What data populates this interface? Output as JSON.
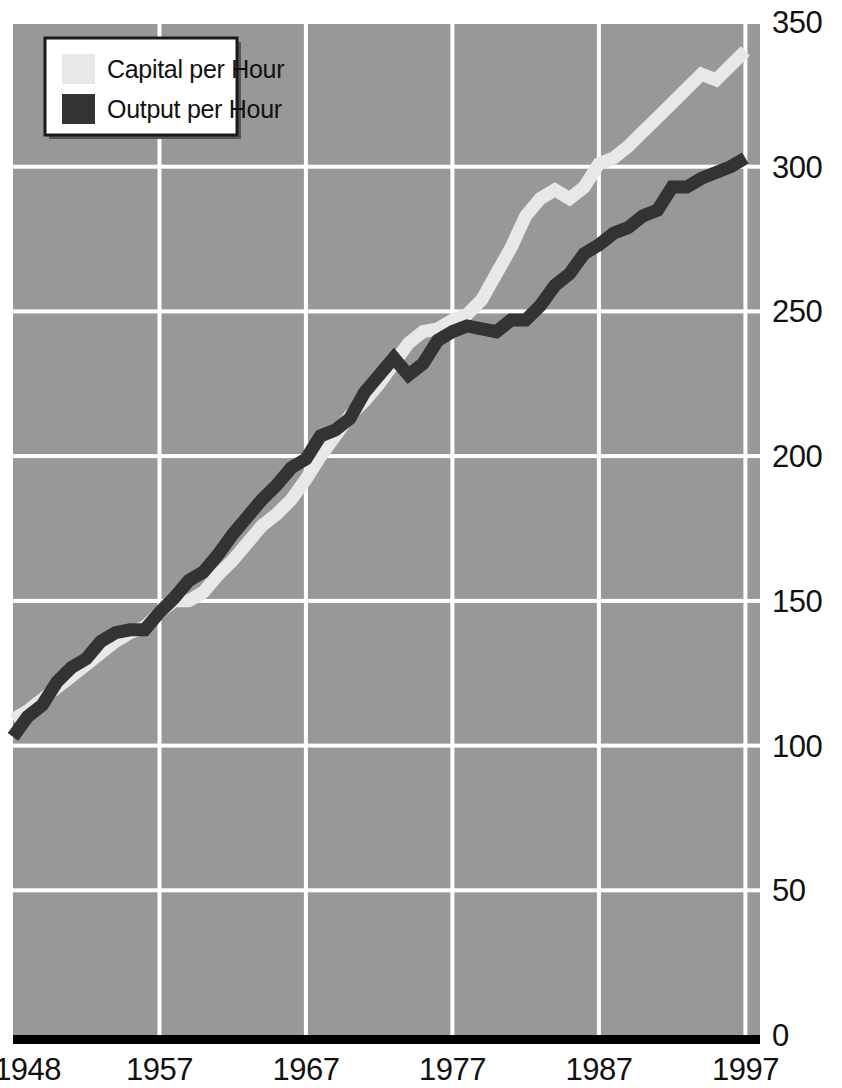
{
  "chart_data": {
    "type": "line",
    "title": "",
    "subtitle": "",
    "xlabel": "",
    "ylabel": "",
    "xlim": [
      1947,
      1998
    ],
    "ylim": [
      0,
      350
    ],
    "grid": true,
    "grid_color": "#ffffff",
    "plot_bgcolor": "#989898",
    "legend_position": "top-left",
    "xticks": [
      "1948",
      "1957",
      "1967",
      "1977",
      "1987",
      "1997"
    ],
    "xtick_values": [
      1948,
      1957,
      1967,
      1977,
      1987,
      1997
    ],
    "yticks": [
      "0",
      "50",
      "100",
      "150",
      "200",
      "250",
      "300",
      "350"
    ],
    "ytick_values": [
      0,
      50,
      100,
      150,
      200,
      250,
      300,
      350
    ],
    "x": [
      1947,
      1948,
      1949,
      1950,
      1951,
      1952,
      1953,
      1954,
      1955,
      1956,
      1957,
      1958,
      1959,
      1960,
      1961,
      1962,
      1963,
      1964,
      1965,
      1966,
      1967,
      1968,
      1969,
      1970,
      1971,
      1972,
      1973,
      1974,
      1975,
      1976,
      1977,
      1978,
      1979,
      1980,
      1981,
      1982,
      1983,
      1984,
      1985,
      1986,
      1987,
      1988,
      1989,
      1990,
      1991,
      1992,
      1993,
      1994,
      1995,
      1996,
      1997
    ],
    "series": [
      {
        "name": "Capital per Hour",
        "color": "#e8e8e8",
        "values": [
          109,
          112,
          116,
          120,
          124,
          128,
          132,
          136,
          139,
          141,
          146,
          150,
          150,
          153,
          159,
          164,
          170,
          176,
          180,
          185,
          192,
          200,
          207,
          214,
          219,
          225,
          232,
          239,
          243,
          244,
          247,
          249,
          254,
          263,
          272,
          283,
          289,
          292,
          289,
          293,
          301,
          303,
          307,
          312,
          317,
          322,
          327,
          332,
          330,
          335,
          340
        ]
      },
      {
        "name": "Output per Hour",
        "color": "#333333",
        "values": [
          103,
          110,
          114,
          122,
          127,
          130,
          136,
          139,
          140,
          140,
          146,
          151,
          157,
          160,
          166,
          173,
          179,
          185,
          190,
          196,
          199,
          207,
          209,
          213,
          222,
          228,
          234,
          228,
          232,
          240,
          243,
          245,
          244,
          243,
          247,
          247,
          252,
          259,
          263,
          270,
          273,
          277,
          279,
          283,
          285,
          293,
          293,
          296,
          298,
          300,
          303
        ]
      }
    ]
  },
  "legend": {
    "items": [
      {
        "label": "Capital per Hour",
        "swatch": "#e8e8e8"
      },
      {
        "label": "Output per Hour",
        "swatch": "#333333"
      }
    ]
  },
  "axis": {
    "baseline_color": "#000000"
  }
}
